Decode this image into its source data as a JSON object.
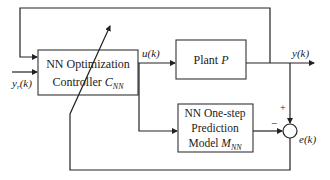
{
  "diagram": {
    "controller": {
      "line1": "NN Optimization",
      "line2": "Controller ",
      "symbol": "C",
      "sub": "NN"
    },
    "plant": {
      "label": "Plant ",
      "symbol": "P"
    },
    "predictor": {
      "line1": "NN One-step",
      "line2": "Prediction",
      "line3": "Model ",
      "symbol": "M",
      "sub": "NN"
    },
    "signals": {
      "control": "u(k)",
      "output": "y(k)",
      "reference_main": "y",
      "reference_sub": "r",
      "reference_arg": "(k)",
      "error": "e(k)"
    },
    "summing_junction": {
      "plus": "+",
      "minus": "−"
    }
  }
}
